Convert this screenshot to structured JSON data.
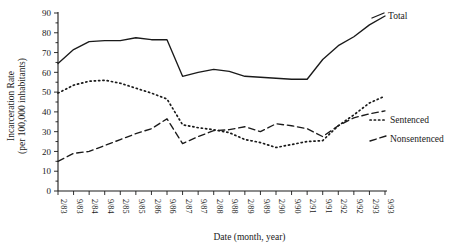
{
  "chart_data": {
    "type": "line",
    "title": "",
    "xlabel": "Date (month, year)",
    "ylabel": "Incarceration Rate\n(per 100,000 inhabitants)",
    "ylabel_line1": "Incarceration Rate",
    "ylabel_line2": "(per 100,000 inhabitants)",
    "ylim": [
      0,
      90
    ],
    "yticks": [
      0,
      10,
      20,
      30,
      40,
      50,
      60,
      70,
      80,
      90
    ],
    "ytick_labels": [
      "0",
      "10",
      "20",
      "30",
      "40",
      "50",
      "60",
      "70",
      "80",
      "90"
    ],
    "grid": false,
    "legend_position": "right-inline",
    "categories": [
      "2/83",
      "9/83",
      "2/84",
      "9/84",
      "2/85",
      "9/85",
      "2/86",
      "9/86",
      "2/87",
      "9/87",
      "2/88",
      "9/88",
      "2/89",
      "9/89",
      "2/90",
      "9/90",
      "2/91",
      "9/91",
      "2/92",
      "9/92",
      "2/93",
      "9/93"
    ],
    "series": [
      {
        "name": "Total",
        "style": "solid",
        "color": "#1a1a1a",
        "values": [
          64.5,
          71.5,
          75.5,
          76.0,
          76.0,
          77.5,
          76.5,
          76.5,
          58.0,
          60.0,
          61.5,
          60.5,
          58.0,
          57.5,
          57.0,
          56.5,
          56.5,
          66.5,
          73.5,
          78.0,
          84.0,
          88.5
        ]
      },
      {
        "name": "Sentenced",
        "style": "dotted",
        "color": "#1a1a1a",
        "values": [
          49.5,
          53.5,
          55.5,
          56.0,
          54.5,
          52.0,
          49.5,
          46.5,
          33.5,
          32.0,
          31.0,
          29.5,
          26.0,
          24.5,
          22.0,
          23.5,
          25.0,
          25.5,
          33.0,
          38.5,
          44.5,
          48.0
        ]
      },
      {
        "name": "Nonsentenced",
        "style": "dashed",
        "color": "#1a1a1a",
        "values": [
          15.0,
          19.0,
          20.0,
          23.0,
          26.0,
          29.0,
          31.5,
          36.5,
          24.0,
          27.5,
          30.5,
          31.0,
          32.5,
          30.0,
          34.0,
          33.0,
          31.5,
          27.5,
          33.0,
          37.0,
          39.0,
          40.5
        ]
      }
    ],
    "legend": [
      {
        "label": "Total",
        "style": "solid"
      },
      {
        "label": "Sentenced",
        "style": "dotted"
      },
      {
        "label": "Nonsentenced",
        "style": "dashed"
      }
    ]
  }
}
